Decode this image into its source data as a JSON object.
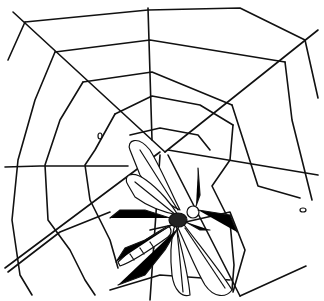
{
  "image": {
    "description": "Black and white line drawing of a spider web with a winged insect caught near its center",
    "width": 324,
    "height": 301,
    "colors": {
      "ink": "#111111",
      "background": "#ffffff"
    }
  },
  "web": {
    "hub": [
      163,
      150
    ],
    "radials": [
      [
        [
          148,
          8
        ],
        [
          163,
          150
        ]
      ],
      [
        [
          13,
          12
        ],
        [
          163,
          150
        ]
      ],
      [
        [
          318,
          30
        ],
        [
          163,
          150
        ]
      ],
      [
        [
          160,
          150
        ],
        [
          5,
          268
        ]
      ],
      [
        [
          163,
          150
        ],
        [
          240,
          296
        ]
      ],
      [
        [
          163,
          150
        ],
        [
          150,
          300
        ]
      ]
    ],
    "rings": [
      "M25,22 L148,10 L240,8 L305,40 L320,100",
      "M55,52 L150,42 L285,62 L296,150 L312,200",
      "M83,82 L152,72 L232,105 L255,160 L310,200",
      "M115,114 L155,96 L200,118 L233,185",
      "M5,168 L40,168 L120,165",
      "M8,272 L60,230 L100,220",
      "M18,186 L30,250 L32,295",
      "M45,150 L60,240 L88,295",
      "M75,140 L95,220 L120,265",
      "M100,140 L112,200",
      "M240,296 L306,266",
      "M232,212 L245,250 L233,290",
      "M8,60 L20,25",
      "M300,40 L318,98"
    ]
  },
  "insect": {
    "label": "winged insect",
    "body_center": [
      185,
      215
    ]
  }
}
